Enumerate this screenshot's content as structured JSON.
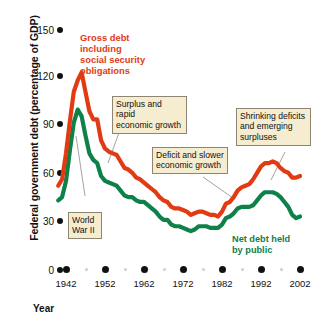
{
  "axes": {
    "ylabel": "Federal government debt (percentage of GDP)",
    "xlabel": "Year",
    "yticks": [
      "0",
      "30",
      "60",
      "90",
      "120",
      "150"
    ],
    "xticks": [
      "1942",
      "1952",
      "1962",
      "1972",
      "1982",
      "1992",
      "2002"
    ]
  },
  "annotations": {
    "gross_debt": "Gross debt\nincluding\nsocial security\nobligations",
    "gross_debt_lines": [
      "Gross debt",
      "including",
      "social security",
      "obligations"
    ],
    "net_debt_lines": [
      "Net debt held",
      "by public"
    ],
    "world_war_lines": [
      "World",
      "War II"
    ],
    "surplus_lines": [
      "Surplus and rapid",
      "economic growth"
    ],
    "deficit_lines": [
      "Deficit and slower",
      "economic growth"
    ],
    "shrinking_lines": [
      "Shrinking deficits",
      "and emerging",
      "surpluses"
    ]
  },
  "colors": {
    "gross_debt": "#e23b13",
    "net_debt": "#0e8049",
    "callout_fill": "#f6ecd0",
    "callout_border": "#8d8574",
    "leader": "#7a7a7a",
    "axis_text": "#111111"
  },
  "chart_data": {
    "type": "line",
    "title": "",
    "xlabel": "Year",
    "ylabel": "Federal government debt (percentage of GDP)",
    "xlim": [
      1940,
      2004
    ],
    "ylim": [
      0,
      150
    ],
    "yticks": [
      0,
      30,
      60,
      90,
      120,
      150
    ],
    "xticks": [
      1942,
      1952,
      1962,
      1972,
      1982,
      1992,
      2002
    ],
    "grid": false,
    "legend": "inline-labels",
    "x": [
      1940,
      1941,
      1942,
      1943,
      1944,
      1945,
      1946,
      1947,
      1948,
      1949,
      1950,
      1951,
      1952,
      1953,
      1954,
      1955,
      1956,
      1957,
      1958,
      1959,
      1960,
      1961,
      1962,
      1963,
      1964,
      1965,
      1966,
      1967,
      1968,
      1969,
      1970,
      1971,
      1972,
      1973,
      1974,
      1975,
      1976,
      1977,
      1978,
      1979,
      1980,
      1981,
      1982,
      1983,
      1984,
      1985,
      1986,
      1987,
      1988,
      1989,
      1990,
      1991,
      1992,
      1993,
      1994,
      1995,
      1996,
      1997,
      1998,
      1999,
      2000,
      2001,
      2002
    ],
    "series": [
      {
        "name": "Gross debt including social security obligations",
        "color": "#e23b13",
        "values": [
          52,
          56,
          72,
          92,
          110,
          117,
          122,
          110,
          98,
          93,
          93,
          80,
          75,
          73,
          72,
          71,
          67,
          63,
          62,
          60,
          57,
          56,
          54,
          52,
          50,
          48,
          45,
          43,
          42,
          39,
          38,
          38,
          37,
          36,
          34,
          35,
          36,
          36,
          35,
          34,
          34,
          33,
          36,
          41,
          42,
          45,
          49,
          51,
          52,
          53,
          56,
          60,
          64,
          66,
          66,
          67,
          66,
          63,
          61,
          60,
          57,
          57,
          58
        ]
      },
      {
        "name": "Net debt held by public",
        "color": "#0e8049",
        "values": [
          43,
          45,
          55,
          74,
          91,
          99,
          95,
          83,
          72,
          68,
          66,
          58,
          55,
          54,
          53,
          52,
          49,
          46,
          45,
          45,
          43,
          42,
          42,
          40,
          38,
          36,
          33,
          31,
          31,
          28,
          27,
          27,
          26,
          25,
          24,
          25,
          27,
          27,
          27,
          26,
          26,
          26,
          28,
          32,
          33,
          35,
          38,
          39,
          39,
          39,
          40,
          43,
          46,
          48,
          48,
          48,
          47,
          45,
          42,
          39,
          34,
          32,
          33
        ]
      }
    ]
  }
}
